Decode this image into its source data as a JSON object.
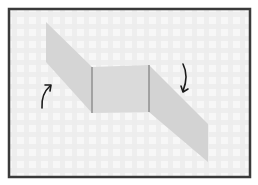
{
  "diagram": {
    "type": "origami-fold-step",
    "frame": {
      "x": 9,
      "y": 9,
      "width": 242,
      "height": 169,
      "stroke": "#3a3a3a"
    },
    "background": {
      "pattern": "plaid",
      "base": "#f6f6f6",
      "stripe": "#e6e6e6"
    },
    "paper": {
      "fill_flap": "#d4d4d4",
      "fill_center": "#d9d9d9",
      "crease_color": "#8a8a8a",
      "left_flap": [
        [
          46,
          22
        ],
        [
          92,
          67
        ],
        [
          92,
          113
        ],
        [
          46,
          62
        ]
      ],
      "center_panel": [
        [
          92,
          67
        ],
        [
          149,
          65
        ],
        [
          149,
          112
        ],
        [
          92,
          113
        ]
      ],
      "right_flap": [
        [
          149,
          65
        ],
        [
          208,
          124
        ],
        [
          208,
          162
        ],
        [
          149,
          112
        ]
      ]
    },
    "arrows": [
      {
        "name": "fold-up-arrow",
        "direction": "up",
        "position": "left",
        "color": "#1a1a1a"
      },
      {
        "name": "fold-down-arrow",
        "direction": "down",
        "position": "right",
        "color": "#1a1a1a"
      }
    ]
  }
}
